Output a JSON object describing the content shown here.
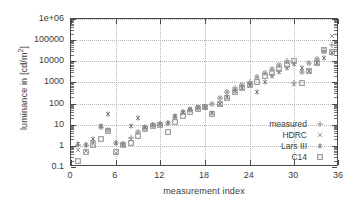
{
  "chart_data": {
    "type": "scatter",
    "title": "",
    "xlabel": "measurement index",
    "ylabel": "luminance in [cd/m²]",
    "ylabel_prefix": "luminance in [cd/m",
    "ylabel_sup": "2",
    "ylabel_suffix": "]",
    "yscale": "log",
    "xscale": "linear",
    "xlim": [
      0,
      36
    ],
    "ylim": [
      0.1,
      1000000
    ],
    "grid": true,
    "legend_position": "bottom-right",
    "xticks": [
      "0",
      "6",
      "12",
      "18",
      "24",
      "30",
      "36"
    ],
    "xtick_values": [
      0,
      6,
      12,
      18,
      24,
      30,
      36
    ],
    "yticks": [
      "0.1",
      "1",
      "10",
      "100",
      "1000",
      "10000",
      "100000",
      "1e+06"
    ],
    "ytick_values": [
      0.1,
      1,
      10,
      100,
      1000,
      10000,
      100000,
      1000000
    ],
    "x": [
      1,
      2,
      3,
      4,
      5,
      6,
      7,
      8,
      9,
      10,
      11,
      12,
      13,
      14,
      15,
      16,
      17,
      18,
      19,
      20,
      21,
      22,
      23,
      24,
      25,
      26,
      27,
      28,
      29,
      30,
      31,
      32,
      33,
      34,
      35
    ],
    "series": [
      {
        "name": "measured",
        "marker": "plus",
        "color": "#8e8e8e",
        "values": [
          1.15,
          1.1,
          1.75,
          8.2,
          5.5,
          1.3,
          1.2,
          2.3,
          4.6,
          7.3,
          9.5,
          10.5,
          12.0,
          24.0,
          38.0,
          52.0,
          64.0,
          68.0,
          95.0,
          185.0,
          360.0,
          520.0,
          750.0,
          1000.0,
          1900.0,
          2800.0,
          4200.0,
          6500.0,
          9800.0,
          900.0,
          3200.0,
          8000.0,
          13000.0,
          30000.0,
          60000.0
        ]
      },
      {
        "name": "HDRC",
        "marker": "cross",
        "color": "#9a9a9a",
        "values": [
          0.62,
          0.55,
          1.2,
          8.2,
          5.4,
          0.45,
          1.25,
          2.2,
          4.5,
          7.2,
          9.2,
          10.4,
          11.5,
          23.5,
          37.0,
          51.0,
          63.0,
          66.0,
          92.0,
          180.0,
          350.0,
          510.0,
          730.0,
          980.0,
          1850.0,
          2750.0,
          4100.0,
          6400.0,
          9700.0,
          880.0,
          3100.0,
          7900.0,
          12800.0,
          29000.0,
          150000.0
        ]
      },
      {
        "name": "Lars III",
        "marker": "star",
        "color": "#7d7d7d",
        "values": [
          1.2,
          1.15,
          2.0,
          8.5,
          33.0,
          1.35,
          1.25,
          8.6,
          21.0,
          7.8,
          9.8,
          10.8,
          12.5,
          25.0,
          40.0,
          54.0,
          66.0,
          70.0,
          34.0,
          98.0,
          195.0,
          380.0,
          540.0,
          790.0,
          350.0,
          1050.0,
          2100.0,
          3100.0,
          4600.0,
          7200.0,
          5000.0,
          3400.0,
          8600.0,
          14000.0,
          26000.0
        ]
      },
      {
        "name": "C14",
        "marker": "square",
        "color": "#8a8a8a",
        "values": [
          0.19,
          0.5,
          1.1,
          2.1,
          5.1,
          0.5,
          1.15,
          1.35,
          3.0,
          6.6,
          8.8,
          9.6,
          4.5,
          13.0,
          25.0,
          42.0,
          56.0,
          68.0,
          31.0,
          96.0,
          190.0,
          370.0,
          530.0,
          760.0,
          1000.0,
          1950.0,
          2900.0,
          4400.0,
          6800.0,
          10000.0,
          900.0,
          3300.0,
          8200.0,
          35000.0,
          27000.0
        ]
      }
    ]
  },
  "legend": {
    "items": [
      {
        "label": "measured",
        "marker": "plus"
      },
      {
        "label": "HDRC",
        "marker": "cross"
      },
      {
        "label": "Lars III",
        "marker": "star"
      },
      {
        "label": "C14",
        "marker": "square"
      }
    ]
  }
}
